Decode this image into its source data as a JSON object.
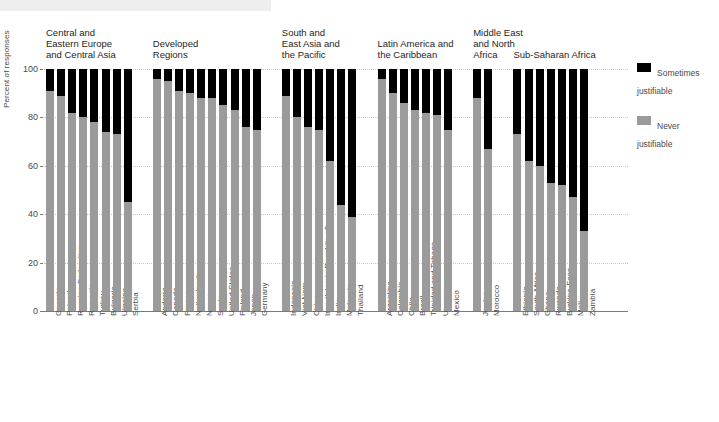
{
  "chart_data": {
    "type": "bar",
    "subtype": "stacked-bar",
    "title": "",
    "xlabel": "",
    "ylabel": "Percent of responses",
    "ylim": [
      0,
      100
    ],
    "yticks": [
      0,
      20,
      40,
      60,
      80,
      100
    ],
    "grid": true,
    "legend_position": "right",
    "colors": {
      "sometimes_justifiable": "#000000",
      "never_justifiable": "#9b9b9b",
      "gridline": "#c9c9c9",
      "axis": "#7a7a7a",
      "text": "#4a4a4a",
      "top_band": "#eeeeee"
    },
    "series": [
      {
        "name": "Never justifiable",
        "color": "#9b9b9b"
      },
      {
        "name": "Sometimes justifiable",
        "color": "#000000"
      }
    ],
    "groups": [
      {
        "region": "Central and\nEastern Europe\nand Central Asia",
        "categories": [
          "Georgia",
          "Poland",
          "Russian Federation",
          "Romania",
          "Turkey",
          "Bulgaria",
          "Ukraine",
          "Serbia"
        ],
        "never": [
          91,
          89,
          82,
          80,
          78,
          74,
          73,
          45
        ],
        "sometimes": [
          9,
          11,
          18,
          20,
          22,
          26,
          27,
          55
        ]
      },
      {
        "region": "Developed\nRegions",
        "categories": [
          "Andorra",
          "Canada",
          "France",
          "Netherlands",
          "Norway",
          "Spain",
          "United States",
          "Finland",
          "Japan",
          "Germany"
        ],
        "never": [
          96,
          95,
          91,
          90,
          88,
          88,
          85,
          83,
          76,
          75
        ],
        "sometimes": [
          4,
          5,
          9,
          10,
          12,
          12,
          15,
          17,
          24,
          25
        ]
      },
      {
        "region": "South and\nEast Asia and\nthe Pacific",
        "categories": [
          "Indonesia",
          "Viet Nam",
          "China",
          "Iran (Islamic Republic of)",
          "India",
          "Malaysia",
          "Thailand"
        ],
        "never": [
          89,
          80,
          76,
          75,
          62,
          44,
          39
        ],
        "sometimes": [
          11,
          20,
          24,
          25,
          38,
          56,
          61
        ]
      },
      {
        "region": "Latin America and\nthe Caribbean",
        "categories": [
          "Argentina",
          "Colombia",
          "Chile",
          "Brazil",
          "Trinidad and Tobago",
          "Uruguay",
          "Mexico"
        ],
        "never": [
          96,
          90,
          86,
          83,
          82,
          81,
          75
        ],
        "sometimes": [
          4,
          10,
          14,
          17,
          18,
          19,
          25
        ]
      },
      {
        "region": "Middle East\nand North\nAfrica",
        "categories": [
          "Jordan",
          "Morocco"
        ],
        "never": [
          88,
          67
        ],
        "sometimes": [
          12,
          33
        ]
      },
      {
        "region": "Sub-Saharan Africa",
        "categories": [
          "Ethiopia",
          "South Africa",
          "Ghana",
          "Rwanda",
          "Burkina Faso",
          "Mali",
          "Zambia"
        ],
        "never": [
          73,
          62,
          60,
          53,
          52,
          47,
          33
        ],
        "sometimes": [
          27,
          38,
          40,
          47,
          48,
          53,
          67
        ]
      }
    ]
  },
  "legend": {
    "items": [
      {
        "label": "Sometimes\njustifiable",
        "color": "#000000"
      },
      {
        "label": "Never\njustifiable",
        "color": "#9b9b9b"
      }
    ]
  }
}
